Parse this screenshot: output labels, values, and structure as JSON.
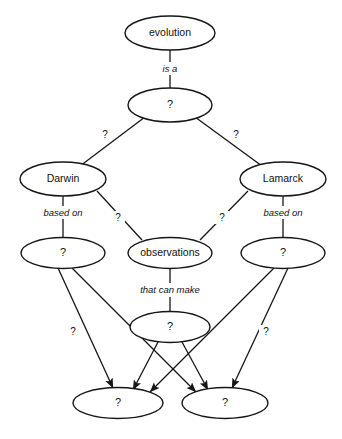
{
  "diagram": {
    "background_color": "#ffffff",
    "line_color": "#161616",
    "nodes": {
      "evolution": "evolution",
      "level2_q": "?",
      "darwin": "Darwin",
      "lamarck": "Lamarck",
      "darwin_basis_q": "?",
      "observations": "observations",
      "lamarck_basis_q": "?",
      "middle_q": "?",
      "bottom_left_q": "?",
      "bottom_right_q": "?"
    },
    "edge_labels": {
      "is_a": "is a",
      "q_left_branch": "?",
      "q_right_branch": "?",
      "darwin_based_on": "based on",
      "q_darwin_to_observations": "?",
      "q_lamarck_to_observations": "?",
      "lamarck_based_on": "based on",
      "that_can_make": "that can make",
      "q_left_down": "?",
      "q_right_down": "?"
    }
  }
}
